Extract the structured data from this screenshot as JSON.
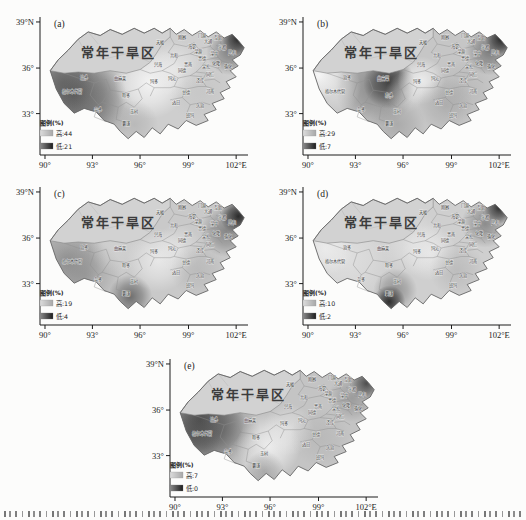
{
  "figure": {
    "arid_label": "常年干旱区",
    "axis": {
      "y_ticks": [
        "39°N",
        "36°",
        "33°"
      ],
      "x_ticks": [
        "90°",
        "93°",
        "96°",
        "99°",
        "102°E"
      ]
    },
    "legend_title": "图例(%)",
    "panels": [
      {
        "id": "a",
        "label": "(a)",
        "legend_high": "高:44",
        "legend_low": "低:21",
        "high_value": 44,
        "low_value": 21,
        "shading": {
          "base": "#cecece",
          "spots": [
            [
              14,
              62,
              26,
              "#454545",
              0.85
            ],
            [
              8,
              52,
              16,
              "#5a5a5a",
              0.6
            ],
            [
              24,
              74,
              20,
              "#6e6e6e",
              0.5
            ],
            [
              96,
              16,
              8,
              "#0f0f0f",
              0.95
            ],
            [
              92,
              26,
              12,
              "#4a4a4a",
              0.6
            ],
            [
              52,
              52,
              18,
              "#f7f7f7",
              0.9
            ],
            [
              64,
              40,
              14,
              "#ededed",
              0.7
            ],
            [
              44,
              86,
              12,
              "#9a9a9a",
              0.4
            ],
            [
              78,
              60,
              16,
              "#bdbdbd",
              0.4
            ]
          ]
        }
      },
      {
        "id": "b",
        "label": "(b)",
        "legend_high": "高:29",
        "legend_low": "低:7",
        "high_value": 29,
        "low_value": 7,
        "shading": {
          "base": "#c6c6c6",
          "spots": [
            [
              40,
              52,
              13,
              "#222222",
              0.9
            ],
            [
              33,
              56,
              20,
              "#555555",
              0.55
            ],
            [
              5,
              46,
              12,
              "#fdfdfd",
              0.95
            ],
            [
              12,
              55,
              14,
              "#e8e8e8",
              0.6
            ],
            [
              96,
              16,
              8,
              "#0f0f0f",
              0.95
            ],
            [
              90,
              26,
              12,
              "#4a4a4a",
              0.6
            ],
            [
              56,
              50,
              12,
              "#f2f2f2",
              0.85
            ],
            [
              48,
              60,
              10,
              "#e5e5e5",
              0.5
            ],
            [
              44,
              86,
              14,
              "#8a8a8a",
              0.45
            ],
            [
              76,
              58,
              16,
              "#a8a8a8",
              0.4
            ],
            [
              68,
              70,
              14,
              "#909090",
              0.4
            ]
          ]
        }
      },
      {
        "id": "c",
        "label": "(c)",
        "legend_high": "高:19",
        "legend_low": "低:4",
        "high_value": 19,
        "low_value": 4,
        "shading": {
          "base": "#c9c9c9",
          "spots": [
            [
              10,
              58,
              20,
              "#6a6a6a",
              0.55
            ],
            [
              20,
              70,
              18,
              "#7a7a7a",
              0.45
            ],
            [
              96,
              22,
              9,
              "#101010",
              0.9
            ],
            [
              90,
              34,
              13,
              "#4f4f4f",
              0.55
            ],
            [
              42,
              88,
              11,
              "#3d3d3d",
              0.65
            ],
            [
              56,
              58,
              16,
              "#f0f0f0",
              0.8
            ],
            [
              66,
              48,
              12,
              "#e9e9e9",
              0.6
            ],
            [
              36,
              48,
              14,
              "#d8d8d8",
              0.5
            ],
            [
              76,
              66,
              14,
              "#a0a0a0",
              0.35
            ]
          ]
        }
      },
      {
        "id": "d",
        "label": "(d)",
        "legend_high": "高:10",
        "legend_low": "低:2",
        "high_value": 10,
        "low_value": 2,
        "shading": {
          "base": "#cfcfcf",
          "spots": [
            [
              18,
              56,
              24,
              "#e4e4e4",
              0.75
            ],
            [
              8,
              48,
              14,
              "#efefef",
              0.8
            ],
            [
              40,
              92,
              8,
              "#0c0c0c",
              0.9
            ],
            [
              43,
              83,
              11,
              "#555555",
              0.5
            ],
            [
              95,
              15,
              8,
              "#161616",
              0.9
            ],
            [
              88,
              28,
              12,
              "#555555",
              0.55
            ],
            [
              60,
              52,
              14,
              "#f1f1f1",
              0.7
            ],
            [
              74,
              66,
              14,
              "#9a9a9a",
              0.35
            ],
            [
              52,
              44,
              16,
              "#e8e8e8",
              0.6
            ]
          ]
        }
      },
      {
        "id": "e",
        "label": "(e)",
        "legend_high": "高:7",
        "legend_low": "低:0",
        "high_value": 7,
        "low_value": 0,
        "shading": {
          "base": "#c4c4c4",
          "spots": [
            [
              12,
              48,
              22,
              "#3c3c3c",
              0.85
            ],
            [
              22,
              58,
              20,
              "#555555",
              0.6
            ],
            [
              8,
              62,
              14,
              "#4a4a4a",
              0.6
            ],
            [
              46,
              70,
              16,
              "#f4f4f4",
              0.85
            ],
            [
              56,
              56,
              13,
              "#ececec",
              0.6
            ],
            [
              36,
              80,
              12,
              "#d6d6d6",
              0.5
            ],
            [
              95,
              18,
              8,
              "#2e2e2e",
              0.8
            ],
            [
              88,
              30,
              12,
              "#6a6a6a",
              0.45
            ],
            [
              72,
              62,
              15,
              "#a5a5a5",
              0.35
            ],
            [
              44,
              90,
              10,
              "#7c7c7c",
              0.45
            ]
          ]
        }
      }
    ],
    "counties": [
      {
        "n": "治多",
        "x": 19,
        "y": 49
      },
      {
        "n": "曲麻莱",
        "x": 37,
        "y": 50
      },
      {
        "n": "格尔木代管",
        "x": 13,
        "y": 60
      },
      {
        "n": "杂多",
        "x": 26,
        "y": 75
      },
      {
        "n": "称多",
        "x": 40,
        "y": 64
      },
      {
        "n": "玉树",
        "x": 44,
        "y": 77
      },
      {
        "n": "囊谦",
        "x": 40,
        "y": 87
      },
      {
        "n": "玛多",
        "x": 54,
        "y": 52
      },
      {
        "n": "天峻",
        "x": 57,
        "y": 20
      },
      {
        "n": "刚察",
        "x": 68,
        "y": 16
      },
      {
        "n": "海晏",
        "x": 73,
        "y": 23
      },
      {
        "n": "门源",
        "x": 78,
        "y": 14
      },
      {
        "n": "大通",
        "x": 81,
        "y": 19
      },
      {
        "n": "互助",
        "x": 86,
        "y": 16
      },
      {
        "n": "乐都",
        "x": 88,
        "y": 24
      },
      {
        "n": "民和",
        "x": 93,
        "y": 28
      },
      {
        "n": "湟源",
        "x": 76,
        "y": 27
      },
      {
        "n": "湟中",
        "x": 84,
        "y": 29
      },
      {
        "n": "化隆",
        "x": 85,
        "y": 37
      },
      {
        "n": "循化",
        "x": 91,
        "y": 40
      },
      {
        "n": "尖扎",
        "x": 80,
        "y": 40
      },
      {
        "n": "贵德",
        "x": 78,
        "y": 33
      },
      {
        "n": "共和",
        "x": 64,
        "y": 31
      },
      {
        "n": "贵南",
        "x": 71,
        "y": 38
      },
      {
        "n": "同德",
        "x": 68,
        "y": 43
      },
      {
        "n": "兴海",
        "x": 56,
        "y": 38
      },
      {
        "n": "同仁",
        "x": 82,
        "y": 46
      },
      {
        "n": "泽库",
        "x": 77,
        "y": 51
      },
      {
        "n": "河南",
        "x": 82,
        "y": 60
      },
      {
        "n": "玛沁",
        "x": 63,
        "y": 50
      },
      {
        "n": "甘德",
        "x": 70,
        "y": 61
      },
      {
        "n": "达日",
        "x": 65,
        "y": 69
      },
      {
        "n": "久治",
        "x": 77,
        "y": 72
      },
      {
        "n": "班玛",
        "x": 72,
        "y": 80
      }
    ],
    "colors": {
      "arid_fill": "#d2d2d2",
      "outline": "#666666",
      "county_line": "#8f8f8f",
      "legend_high_ramp": [
        "#dcdcdc",
        "#a8a8a8"
      ],
      "legend_low_ramp": [
        "#8c8c8c",
        "#1c1c1c"
      ]
    }
  }
}
